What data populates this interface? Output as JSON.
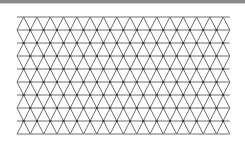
{
  "figure": {
    "type": "triangular-lattice",
    "top_bar_color": "#8a8a8a",
    "line_color": "#6e6e6e",
    "node_color": "#3a3a3a",
    "background": "#ffffff",
    "x0": 17,
    "y0": 17,
    "cell_width": 13.3,
    "row_height": 13,
    "columns": 16,
    "rows": 9
  }
}
